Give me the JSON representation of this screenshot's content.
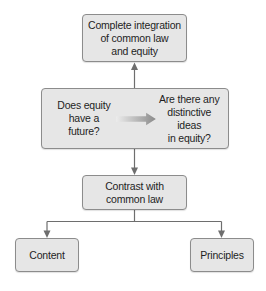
{
  "diagram": {
    "type": "flowchart",
    "nodes": {
      "top": {
        "label": "Complete integration\nof common law\nand equity"
      },
      "middle_left": {
        "label": "Does equity\nhave a future?"
      },
      "middle_right": {
        "label": "Are there any\ndistinctive ideas\nin equity?"
      },
      "contrast": {
        "label": "Contrast with\ncommon law"
      },
      "content": {
        "label": "Content"
      },
      "principles": {
        "label": "Principles"
      }
    },
    "edges": [
      {
        "from": "middle",
        "to": "top",
        "style": "arrow"
      },
      {
        "from": "middle_left",
        "to": "middle_right",
        "style": "gradient-arrow"
      },
      {
        "from": "middle",
        "to": "contrast",
        "style": "arrow"
      },
      {
        "from": "contrast",
        "to": "content",
        "style": "elbow-arrow"
      },
      {
        "from": "contrast",
        "to": "principles",
        "style": "elbow-arrow"
      }
    ],
    "colors": {
      "node_fill": "#e6e6e6",
      "node_border": "#8c8c8c",
      "connector": "#6e6e6e",
      "gradient_arrow_start": "#f0f0f0",
      "gradient_arrow_end": "#8a8a8a"
    }
  }
}
